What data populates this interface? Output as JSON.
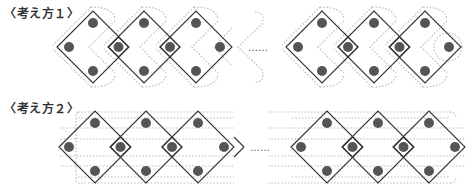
{
  "labels": {
    "approach1": "〈考え方１〉",
    "approach2": "〈考え方２〉"
  },
  "ellipsis": "……",
  "colors": {
    "dot": "#555555",
    "diamond_stroke": "#333333",
    "dotted_guide": "#bbbbbb",
    "background": "#ffffff"
  },
  "figure1": {
    "description": "Chain of diamonds, each with 4 dots at vertices; dotted chevron/loop grouping; small diamond around shared dots",
    "left_group_diamond_count": 3,
    "right_group_diamond_count": 3,
    "dots_per_diamond": 4
  },
  "figure2": {
    "description": "Chain of diamonds, each with 4 dots; dotted horizontal rows grouping dots",
    "left_group_diamond_count": 3,
    "right_group_diamond_count": 3,
    "dots_per_diamond": 4
  }
}
